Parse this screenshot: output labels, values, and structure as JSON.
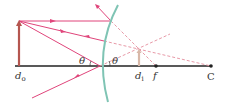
{
  "diagram": {
    "labels": {
      "object_distance": "d₀",
      "object_distance_base": "d",
      "object_distance_sub": "o",
      "image_distance_base": "d",
      "image_distance_sub": "i",
      "focal_point": "f",
      "center": "C",
      "angle_incident": "θ",
      "angle_reflected": "θ"
    },
    "colors": {
      "ray": "#e0457b",
      "ray_dashed": "#e89aa8",
      "object": "#b5564f",
      "image": "#d8b8a8",
      "mirror": "#7fc4b4",
      "axis": "#222222"
    }
  }
}
